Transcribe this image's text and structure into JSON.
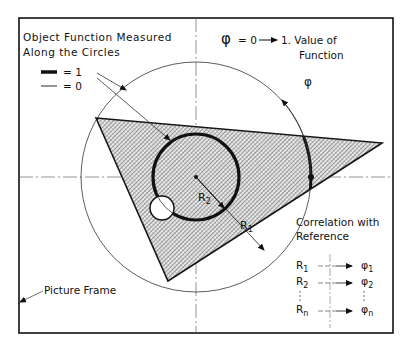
{
  "legend": {
    "title_line1": "Object Function Measured",
    "title_line2": "Along the Circles",
    "thick_label": "= 1",
    "thin_label": "= 0"
  },
  "phi_note": {
    "line1_symbol": "φ",
    "line1_text": "= 0",
    "line1_tail": "1. Value  of",
    "line2": "Function"
  },
  "angle_label": "φ",
  "radius_labels": {
    "r1": "R",
    "r1_sub": "1",
    "r2": "R",
    "r2_sub": "2"
  },
  "correlation": {
    "title_line1": "Correlation  with",
    "title_line2": "Reference",
    "rows": [
      {
        "r": "R",
        "r_sub": "1",
        "phi": "φ",
        "phi_sub": "1"
      },
      {
        "r": "R",
        "r_sub": "2",
        "phi": "φ",
        "phi_sub": "2"
      },
      {
        "r": "R",
        "r_sub": "n",
        "phi": "φ",
        "phi_sub": "n"
      }
    ]
  },
  "frame_label": "Picture Frame",
  "colors": {
    "ink": "#111111",
    "hatch": "#555555",
    "background": "#ffffff"
  }
}
